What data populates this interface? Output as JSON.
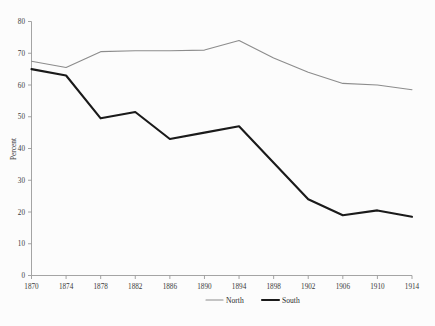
{
  "chart_data": {
    "type": "line",
    "title": "",
    "xlabel": "",
    "ylabel": "Percent",
    "x": [
      1870,
      1874,
      1878,
      1882,
      1886,
      1890,
      1894,
      1898,
      1902,
      1906,
      1910,
      1914
    ],
    "xtick_labels": [
      "1870",
      "1874",
      "1878",
      "1882",
      "1886",
      "1890",
      "1894",
      "1898",
      "1902",
      "1906",
      "1910",
      "1914"
    ],
    "ytick_labels": [
      "0",
      "10",
      "20",
      "30",
      "40",
      "50",
      "60",
      "70",
      "80"
    ],
    "yticks": [
      0,
      10,
      20,
      30,
      40,
      50,
      60,
      70,
      80
    ],
    "ylim": [
      0,
      80
    ],
    "xlim": [
      1870,
      1914
    ],
    "grid": false,
    "legend_position": "bottom-right",
    "series": [
      {
        "name": "North",
        "color": "#8c8c8c",
        "width": 1.1,
        "values": [
          67.5,
          65.5,
          70.5,
          70.8,
          70.8,
          71.0,
          74.0,
          68.5,
          64.0,
          60.5,
          60.0,
          58.5
        ]
      },
      {
        "name": "South",
        "color": "#1a1a1a",
        "width": 2.1,
        "values": [
          65.0,
          63.0,
          49.5,
          51.5,
          43.0,
          45.0,
          47.0,
          35.5,
          24.0,
          19.0,
          20.5,
          18.5
        ]
      }
    ]
  },
  "legend": {
    "items": [
      {
        "label": "North"
      },
      {
        "label": "South"
      }
    ]
  }
}
